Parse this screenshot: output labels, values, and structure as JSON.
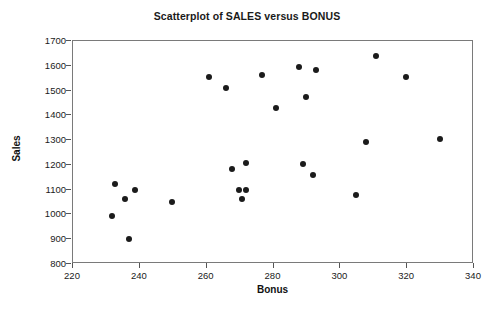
{
  "chart_data": {
    "type": "scatter",
    "title": "Scatterplot of SALES versus BONUS",
    "xlabel": "Bonus",
    "ylabel": "Sales",
    "xlim": [
      220,
      340
    ],
    "ylim": [
      800,
      1700
    ],
    "xticks": [
      220,
      240,
      260,
      280,
      300,
      320,
      340
    ],
    "yticks": [
      800,
      900,
      1000,
      1100,
      1200,
      1300,
      1400,
      1500,
      1600,
      1700
    ],
    "grid": false,
    "legend": null,
    "marker_color": "#1b1b1b",
    "frame_color": "#7a7a7a",
    "points": [
      {
        "x": 232,
        "y": 988
      },
      {
        "x": 233,
        "y": 1120
      },
      {
        "x": 236,
        "y": 1060
      },
      {
        "x": 237,
        "y": 895
      },
      {
        "x": 239,
        "y": 1095
      },
      {
        "x": 250,
        "y": 1045
      },
      {
        "x": 261,
        "y": 1550
      },
      {
        "x": 266,
        "y": 1505
      },
      {
        "x": 268,
        "y": 1180
      },
      {
        "x": 270,
        "y": 1095
      },
      {
        "x": 272,
        "y": 1095
      },
      {
        "x": 271,
        "y": 1060
      },
      {
        "x": 272,
        "y": 1205
      },
      {
        "x": 277,
        "y": 1560
      },
      {
        "x": 281,
        "y": 1425
      },
      {
        "x": 288,
        "y": 1590
      },
      {
        "x": 289,
        "y": 1200
      },
      {
        "x": 290,
        "y": 1470
      },
      {
        "x": 292,
        "y": 1155
      },
      {
        "x": 293,
        "y": 1580
      },
      {
        "x": 305,
        "y": 1075
      },
      {
        "x": 308,
        "y": 1290
      },
      {
        "x": 311,
        "y": 1635
      },
      {
        "x": 320,
        "y": 1550
      },
      {
        "x": 330,
        "y": 1300
      }
    ]
  }
}
